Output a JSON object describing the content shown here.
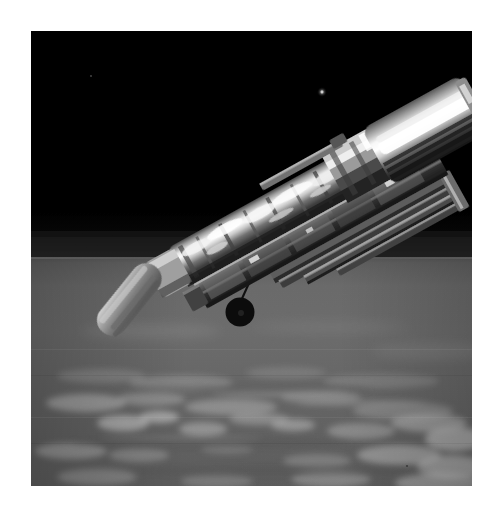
{
  "page": {
    "background_color": "#ffffff",
    "width": 498,
    "height": 514
  },
  "photograph": {
    "subject": "Hubble Space Telescope in orbit above Earth",
    "style": "black and white photograph",
    "frame": {
      "x": 31,
      "y": 31,
      "width": 441,
      "height": 455,
      "border_color": "#ffffff"
    },
    "scene": {
      "space_color": "#000000",
      "horizon_y": 243,
      "earth_limb_color": "#2a2a2a",
      "atmosphere_color": "#6e6e6e",
      "cloud_highlight_color": "#c9c9c9",
      "lower_earth_color": "#5e5e5e"
    },
    "telescope": {
      "label": "Hubble Space Telescope",
      "tilt_degrees": -29,
      "body_color": "#8d8d8d",
      "highlight_color": "#f4f4f4",
      "shadow_color": "#1a1a1a",
      "parts": [
        {
          "name": "aperture-door",
          "label": "Aperture door"
        },
        {
          "name": "forward-shell",
          "label": "Forward light shield"
        },
        {
          "name": "equipment-section",
          "label": "Equipment section"
        },
        {
          "name": "aft-shroud",
          "label": "Aft shroud"
        },
        {
          "name": "solar-array",
          "label": "Solar array panel"
        },
        {
          "name": "high-gain-antenna",
          "label": "High gain antenna dish"
        },
        {
          "name": "antenna-boom",
          "label": "Antenna boom mast"
        }
      ]
    },
    "antenna_dish": {
      "center_x": 240,
      "center_y": 312,
      "radius": 14,
      "color": "#0d0d0d"
    },
    "star_speck": {
      "x": 322,
      "y": 92,
      "color": "#b5b5b5"
    },
    "dark_speck": {
      "x": 127,
      "y": 310,
      "color": "#2e2e2e"
    }
  }
}
